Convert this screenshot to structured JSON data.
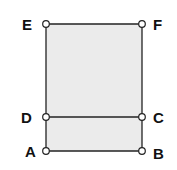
{
  "diagram": {
    "type": "geometry",
    "fill_color": "#ebebeb",
    "stroke_color": "#222222",
    "points": [
      {
        "label": "E",
        "x": 46,
        "y": 24
      },
      {
        "label": "F",
        "x": 142,
        "y": 24
      },
      {
        "label": "D",
        "x": 46,
        "y": 117
      },
      {
        "label": "C",
        "x": 142,
        "y": 117
      },
      {
        "label": "A",
        "x": 46,
        "y": 151
      },
      {
        "label": "B",
        "x": 142,
        "y": 151
      }
    ],
    "segments": [
      [
        "E",
        "F"
      ],
      [
        "F",
        "C"
      ],
      [
        "C",
        "B"
      ],
      [
        "B",
        "A"
      ],
      [
        "A",
        "D"
      ],
      [
        "D",
        "E"
      ],
      [
        "D",
        "C"
      ]
    ]
  },
  "labels": {
    "E": "E",
    "F": "F",
    "D": "D",
    "C": "C",
    "A": "A",
    "B": "B"
  }
}
